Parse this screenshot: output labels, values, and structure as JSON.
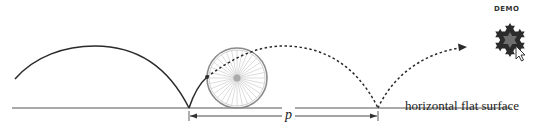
{
  "diagram": {
    "surface_label": "horizontal flat surface",
    "period_label": "p",
    "badge": {
      "label": "DEMO",
      "icon": "koch-snowflake-icon"
    },
    "elements": [
      {
        "type": "line",
        "name": "flat surface",
        "from": [
          12,
          108
        ],
        "to": [
          512,
          108
        ]
      },
      {
        "type": "curve",
        "name": "traced cycloid arch (solid)",
        "from": [
          15,
          79
        ],
        "peak": [
          95,
          46
        ],
        "to": [
          189,
          108
        ]
      },
      {
        "type": "curve",
        "name": "traced segment to wheel point (solid)",
        "from": [
          189,
          108
        ],
        "to": [
          207,
          77
        ]
      },
      {
        "type": "wheel",
        "name": "rolling wheel",
        "center": [
          237,
          78
        ],
        "radius": 30,
        "spokes": 32
      },
      {
        "type": "curve",
        "name": "predicted path (dotted)",
        "from": [
          207,
          77
        ],
        "peak": [
          283,
          46
        ],
        "to": [
          378,
          108
        ]
      },
      {
        "type": "curve",
        "name": "next arch (dotted, with arrow)",
        "from": [
          378,
          108
        ],
        "to": [
          465,
          48
        ]
      },
      {
        "type": "dimension",
        "name": "period p",
        "from": [
          189,
          116
        ],
        "to": [
          378,
          116
        ]
      }
    ]
  },
  "colors": {
    "stroke": "#2a2a2a",
    "wheel": "#8a8a8a",
    "spoke": "#b0b0b0",
    "hub": "#aaaaaa",
    "snowflake": "#2b2b2b",
    "snowflake_inner": "#6e6e6e"
  }
}
